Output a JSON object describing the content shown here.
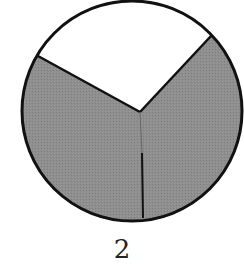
{
  "figure": {
    "label": "2",
    "colors": {
      "shaded": "#8c8c8c",
      "unshaded": "#ffffff",
      "outline": "#111111"
    },
    "sectors": [
      {
        "name": "top",
        "shaded": false
      },
      {
        "name": "lower-left",
        "shaded": true
      },
      {
        "name": "lower-right",
        "shaded": true
      }
    ]
  }
}
